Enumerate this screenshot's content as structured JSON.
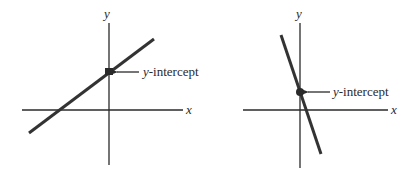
{
  "diagrams": [
    {
      "name": "positive-slope",
      "x_axis_label": "x",
      "y_axis_label": "y",
      "intercept_var": "y",
      "intercept_text": "-intercept"
    },
    {
      "name": "negative-slope",
      "x_axis_label": "x",
      "y_axis_label": "y",
      "intercept_var": "y",
      "intercept_text": "-intercept"
    }
  ],
  "colors": {
    "line": "#333333",
    "axis": "#2a2a2a",
    "background": "#ffffff"
  }
}
